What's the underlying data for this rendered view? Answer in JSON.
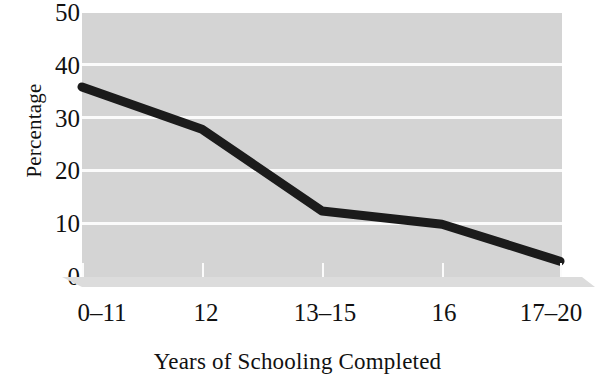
{
  "chart_data": {
    "type": "line",
    "title": "",
    "xlabel": "Years of Schooling Completed",
    "ylabel": "Percentage",
    "categories": [
      "0–11",
      "12",
      "13–15",
      "16",
      "17–20"
    ],
    "values": [
      36,
      28,
      12.5,
      10,
      3
    ],
    "series": [
      {
        "name": "Percentage",
        "values": [
          36,
          28,
          12.5,
          10,
          3
        ]
      }
    ],
    "ylim": [
      0,
      50
    ],
    "y_ticks": [
      0,
      10,
      20,
      30,
      40,
      50
    ],
    "y_tick_labels": [
      "0",
      "10",
      "20",
      "30",
      "40",
      "50"
    ],
    "grid": true,
    "grid_axis": "y",
    "legend": false,
    "legend_position": "none",
    "colors": {
      "line": "#1b1b1b",
      "plot_background": "#d4d4d4",
      "gridline": "#fbfbfb",
      "figure_background": "#ffffff",
      "axis_base": "#dcdcdc",
      "text": "#111111"
    },
    "line_width_px": 9,
    "markers": false
  },
  "axes": {
    "y_title": "Percentage",
    "x_title": "Years of Schooling Completed"
  }
}
